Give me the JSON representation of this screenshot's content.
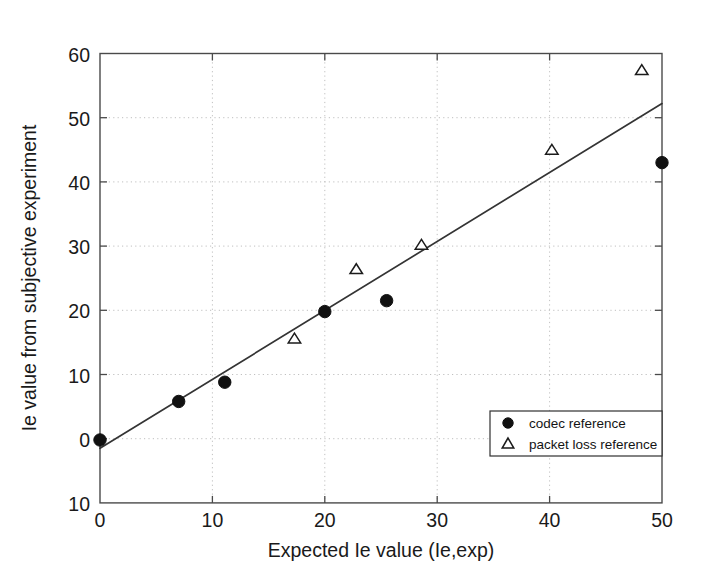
{
  "chart_data": {
    "type": "scatter",
    "title": "",
    "xlabel": "Expected Ie value (Ie,exp)",
    "ylabel": "Ie value from subjective experiment",
    "xlim": [
      0,
      50
    ],
    "ylim": [
      -10,
      60
    ],
    "xticks": [
      0,
      10,
      20,
      30,
      40,
      50
    ],
    "xtick_labels": [
      "0",
      "10",
      "20",
      "30",
      "40",
      "50"
    ],
    "yticks": [
      -10,
      0,
      10,
      20,
      30,
      40,
      50,
      60
    ],
    "ytick_labels": [
      "10",
      "0",
      "10",
      "20",
      "30",
      "40",
      "50",
      "60"
    ],
    "grid": true,
    "legend_position": "lower right",
    "series": [
      {
        "name": "codec reference",
        "marker": "filled-circle",
        "color": "#111111",
        "points": [
          {
            "x": 0.0,
            "y": -0.2
          },
          {
            "x": 7.0,
            "y": 5.8
          },
          {
            "x": 11.1,
            "y": 8.8
          },
          {
            "x": 20.0,
            "y": 19.8
          },
          {
            "x": 25.5,
            "y": 21.5
          },
          {
            "x": 50.0,
            "y": 43.0
          }
        ]
      },
      {
        "name": "packet loss reference",
        "marker": "open-triangle",
        "color": "#1b1b1b",
        "points": [
          {
            "x": 17.3,
            "y": 15.6
          },
          {
            "x": 22.8,
            "y": 26.4
          },
          {
            "x": 28.6,
            "y": 30.2
          },
          {
            "x": 40.2,
            "y": 45.0
          },
          {
            "x": 48.2,
            "y": 57.4
          }
        ]
      }
    ],
    "fit_line": {
      "name": "regression line",
      "from": {
        "x": 0,
        "y": -1.5
      },
      "to": {
        "x": 50,
        "y": 52.2
      }
    }
  },
  "legend": {
    "entries": [
      {
        "label": "codec reference",
        "marker": "filled-circle"
      },
      {
        "label": "packet loss reference",
        "marker": "open-triangle"
      }
    ]
  },
  "axes": {
    "x_title": "Expected Ie value (Ie,exp)",
    "y_title": "Ie value from subjective experiment",
    "x_tick_0": "0",
    "x_tick_1": "10",
    "x_tick_2": "20",
    "x_tick_3": "30",
    "x_tick_4": "40",
    "x_tick_5": "50",
    "y_tick_0": "60",
    "y_tick_1": "50",
    "y_tick_2": "40",
    "y_tick_3": "30",
    "y_tick_4": "20",
    "y_tick_5": "10",
    "y_tick_6": "0",
    "y_tick_7": "10"
  },
  "colors": {
    "axis": "#4a4a4a",
    "grid": "#b9b9b9",
    "line": "#343434",
    "marker_fill": "#111111",
    "background": "#ffffff"
  }
}
